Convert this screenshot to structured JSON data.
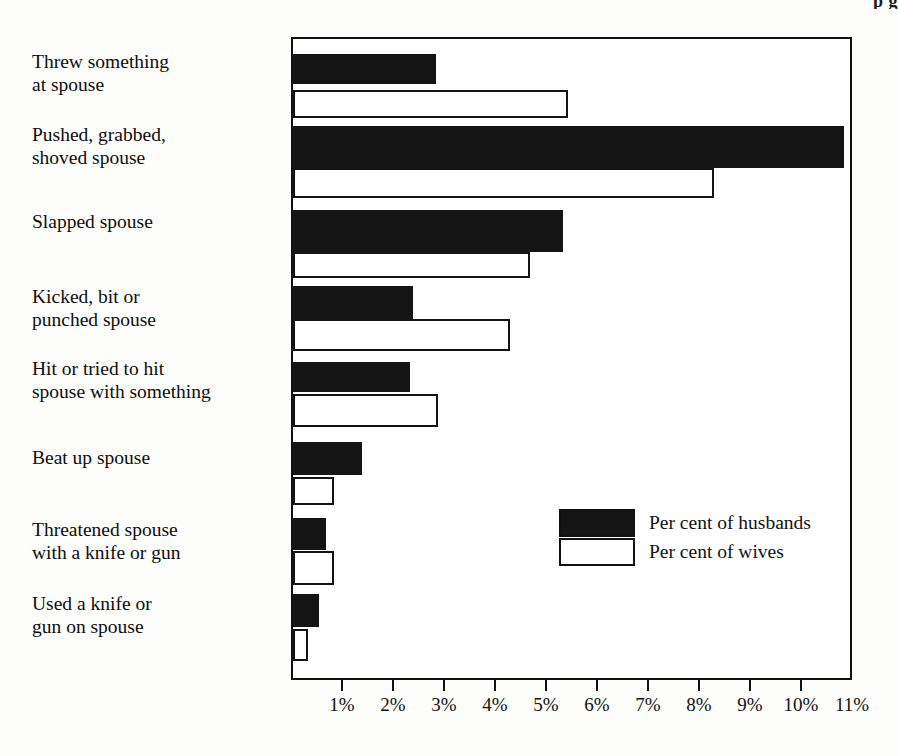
{
  "page_header": "p g",
  "chart_data": {
    "type": "bar",
    "orientation": "horizontal",
    "title": "",
    "subtitle": "",
    "xlabel": "",
    "ylabel": "",
    "xlim": [
      0,
      11
    ],
    "grid": false,
    "legend_position": "inside-right",
    "categories": [
      "Threw something\nat spouse",
      "Pushed, grabbed,\nshoved spouse",
      "Slapped spouse",
      "Kicked, bit or\npunched spouse",
      "Hit or tried to hit\nspouse with something",
      "Beat up spouse",
      "Threatened spouse\nwith a knife or gun",
      "Used a knife or\ngun on spouse"
    ],
    "series": [
      {
        "name": "Per cent of husbands",
        "style": "filled",
        "color": "#141414",
        "values": [
          2.8,
          10.8,
          5.3,
          2.35,
          2.3,
          1.35,
          0.65,
          0.5
        ]
      },
      {
        "name": "Per cent of wives",
        "style": "hollow",
        "color": "#ffffff",
        "values": [
          5.4,
          8.25,
          4.65,
          4.25,
          2.85,
          0.8,
          0.8,
          0.3
        ]
      }
    ],
    "xticks": [
      1,
      2,
      3,
      4,
      5,
      6,
      7,
      8,
      9,
      10,
      11
    ],
    "xticklabels": [
      "1%",
      "2%",
      "3%",
      "4%",
      "5%",
      "6%",
      "7%",
      "8%",
      "9%",
      "10%",
      "11%"
    ]
  },
  "legend": {
    "items": [
      {
        "label": "Per cent of husbands",
        "swatch": "filled"
      },
      {
        "label": "Per cent of wives",
        "swatch": "hollow"
      }
    ]
  },
  "colors": {
    "ink": "#141414",
    "paper": "#fdfdfb",
    "plot_background": "#ffffff"
  }
}
